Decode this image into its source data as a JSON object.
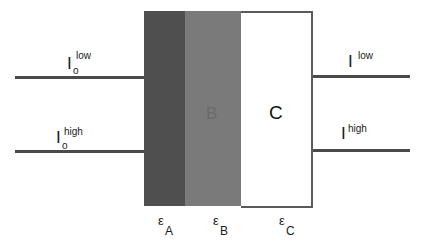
{
  "diagram": {
    "regions": [
      {
        "id": "A",
        "label": "",
        "color": "#4f4f4f"
      },
      {
        "id": "B",
        "label": "B",
        "color": "#7a7a7a"
      },
      {
        "id": "C",
        "label": "C",
        "color": "#ffffff"
      }
    ],
    "inputs": [
      {
        "symbol": "I",
        "sup": "low",
        "sub": "o"
      },
      {
        "symbol": "I",
        "sup": "high",
        "sub": "o"
      }
    ],
    "outputs": [
      {
        "symbol": "I",
        "sup": "low"
      },
      {
        "symbol": "I",
        "sup": "high"
      }
    ],
    "epsilons": [
      {
        "symbol": "ε",
        "sub": "A"
      },
      {
        "symbol": "ε",
        "sub": "B"
      },
      {
        "symbol": "ε",
        "sub": "C"
      }
    ]
  }
}
